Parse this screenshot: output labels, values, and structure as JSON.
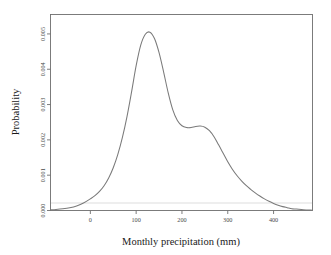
{
  "chart_data": {
    "type": "line",
    "title": "",
    "subtitle": "",
    "xlabel": "Monthly precipitation (mm)",
    "ylabel": "Probability",
    "xlim": [
      -87,
      485
    ],
    "ylim": [
      0,
      0.00555
    ],
    "grid": false,
    "legend": null,
    "x_ticks": [
      0,
      100,
      200,
      300,
      400
    ],
    "x_tick_labels": [
      "0",
      "100",
      "200",
      "300",
      "400"
    ],
    "y_ticks": [
      0,
      0.001,
      0.002,
      0.003,
      0.004,
      0.005
    ],
    "y_tick_labels": [
      "0.000",
      "0.001",
      "0.002",
      "0.003",
      "0.004",
      "0.005"
    ],
    "series": [
      {
        "name": "Kernel density of monthly precipitation",
        "color": "#7a7a7a",
        "x": [
          -87,
          -75,
          -60,
          -45,
          -30,
          -15,
          0,
          10,
          20,
          30,
          40,
          50,
          60,
          70,
          80,
          90,
          100,
          110,
          120,
          130,
          140,
          150,
          160,
          170,
          180,
          190,
          200,
          210,
          220,
          230,
          240,
          250,
          260,
          270,
          280,
          290,
          300,
          310,
          320,
          330,
          340,
          350,
          360,
          370,
          380,
          390,
          400,
          410,
          420,
          430,
          440,
          450,
          465,
          485
        ],
        "y": [
          2e-05,
          3e-05,
          5e-05,
          8e-05,
          0.00013,
          0.00021,
          0.00033,
          0.00042,
          0.00054,
          0.0007,
          0.00092,
          0.00121,
          0.00159,
          0.00207,
          0.00266,
          0.00336,
          0.0041,
          0.00468,
          0.00499,
          0.00505,
          0.00487,
          0.00447,
          0.00392,
          0.00333,
          0.00285,
          0.00255,
          0.0024,
          0.00235,
          0.00235,
          0.00238,
          0.00239,
          0.00236,
          0.00226,
          0.00209,
          0.00186,
          0.00162,
          0.00138,
          0.00117,
          0.00099,
          0.00084,
          0.00071,
          0.0006,
          0.0005,
          0.00041,
          0.00033,
          0.00026,
          0.0002,
          0.00015,
          0.00011,
          8e-05,
          5e-05,
          4e-05,
          2e-05,
          1e-05
        ]
      }
    ],
    "annotations": []
  },
  "axes": {
    "x_title": "Monthly precipitation (mm)",
    "y_title": "Probability"
  },
  "colors": {
    "curve": "#7a7a7a",
    "frame": "#6e6e6e",
    "background": "#ffffff",
    "tick_label": "#4a4a4a",
    "axis_title": "#1a1a1a"
  }
}
